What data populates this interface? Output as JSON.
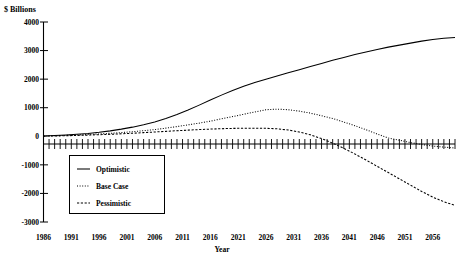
{
  "chart_data": {
    "type": "line",
    "title": "",
    "ylabel": "$ Billions",
    "xlabel": "Year",
    "ylim": [
      -3000,
      4000
    ],
    "xlim": [
      1986,
      2060
    ],
    "grid": false,
    "legend_position": "inside-lower-left",
    "ytick_labels": [
      "4000",
      "3000",
      "2000",
      "1000",
      "0",
      "-1000",
      "-2000",
      "-3000"
    ],
    "ytick_values": [
      4000,
      3000,
      2000,
      1000,
      0,
      -1000,
      -2000,
      -3000
    ],
    "xtick_labels": [
      "1986",
      "1991",
      "1996",
      "2001",
      "2006",
      "2011",
      "2016",
      "2021",
      "2026",
      "2031",
      "2036",
      "2041",
      "2046",
      "2051",
      "2056"
    ],
    "xtick_values": [
      1986,
      1991,
      1996,
      2001,
      2006,
      2011,
      2016,
      2021,
      2026,
      2031,
      2036,
      2041,
      2046,
      2051,
      2056
    ],
    "x": [
      1986,
      1988,
      1990,
      1992,
      1994,
      1996,
      1998,
      2000,
      2002,
      2004,
      2006,
      2008,
      2010,
      2012,
      2014,
      2016,
      2018,
      2020,
      2022,
      2024,
      2026,
      2028,
      2030,
      2032,
      2034,
      2036,
      2038,
      2040,
      2042,
      2044,
      2046,
      2048,
      2050,
      2052,
      2054,
      2056,
      2058,
      2060
    ],
    "series": [
      {
        "name": "Optimistic",
        "style": "solid",
        "color": "#000000",
        "values": [
          10,
          25,
          45,
          70,
          100,
          140,
          190,
          250,
          320,
          400,
          500,
          620,
          760,
          920,
          1090,
          1270,
          1440,
          1600,
          1750,
          1880,
          2000,
          2110,
          2220,
          2330,
          2440,
          2550,
          2660,
          2760,
          2860,
          2950,
          3040,
          3120,
          3190,
          3260,
          3330,
          3390,
          3430,
          3460
        ]
      },
      {
        "name": "Base Case",
        "style": "dotted",
        "color": "#000000",
        "values": [
          8,
          18,
          30,
          45,
          62,
          82,
          105,
          130,
          160,
          195,
          235,
          285,
          340,
          400,
          460,
          530,
          610,
          690,
          770,
          850,
          930,
          950,
          930,
          880,
          810,
          720,
          620,
          500,
          370,
          230,
          80,
          -60,
          -140,
          -220,
          -290,
          -340,
          -380,
          -410
        ]
      },
      {
        "name": "Pessimistic",
        "style": "dashed",
        "color": "#000000",
        "values": [
          5,
          12,
          20,
          30,
          42,
          55,
          70,
          88,
          106,
          128,
          150,
          172,
          195,
          215,
          235,
          252,
          266,
          276,
          282,
          284,
          280,
          262,
          220,
          150,
          50,
          -80,
          -240,
          -420,
          -620,
          -830,
          -1050,
          -1270,
          -1490,
          -1710,
          -1930,
          -2130,
          -2290,
          -2420
        ]
      }
    ],
    "minor_tick_interval": 1
  },
  "legend": {
    "items": [
      {
        "label": "Optimistic"
      },
      {
        "label": "Base Case"
      },
      {
        "label": "Pessimistic"
      }
    ]
  }
}
